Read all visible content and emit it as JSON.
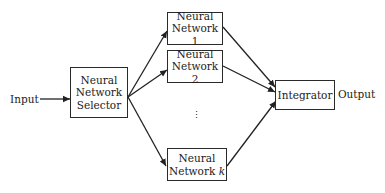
{
  "diagram": {
    "input_label": "Input",
    "output_label": "Output",
    "selector": {
      "line1": "Neural",
      "line2": "Network",
      "line3": "Selector"
    },
    "networks": [
      {
        "line1": "Neural",
        "line2": "Network 1"
      },
      {
        "line1": "Neural",
        "line2": "Network 2"
      },
      {
        "line1": "Neural",
        "line2_prefix": "Network ",
        "line2_var": "k"
      }
    ],
    "ellipsis": "⋮",
    "integrator": "Integrator"
  }
}
